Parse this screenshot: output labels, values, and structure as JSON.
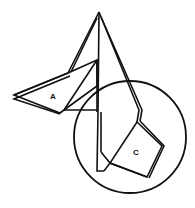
{
  "diagram": {
    "labels": {
      "a": "A",
      "c": "C"
    },
    "colors": {
      "line": "#111111",
      "background": "#ffffff"
    },
    "shapes": {
      "apex": [
        99,
        12
      ],
      "circle": {
        "cx": 130,
        "cy": 137,
        "r": 56
      }
    }
  }
}
